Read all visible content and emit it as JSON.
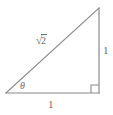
{
  "figure": {
    "type": "right-triangle-diagram",
    "stroke_color": "#8a8a8a",
    "label_color": "#6b6b6b",
    "background_color": "#ffffff",
    "width": 113,
    "height": 115,
    "vertices": {
      "left": {
        "x": 6,
        "y": 93
      },
      "bottom_right": {
        "x": 99,
        "y": 93
      },
      "top_right": {
        "x": 99,
        "y": 8
      }
    },
    "right_angle_marker": {
      "name": "right-angle-square",
      "x": 91,
      "y": 85,
      "size": 8
    },
    "labels": {
      "hypotenuse": {
        "text": "√2",
        "radical_symbol": "√",
        "radicand": "2",
        "meaning": "square root of 2"
      },
      "vertical_leg": {
        "text": "1"
      },
      "horizontal_leg": {
        "text": "1"
      },
      "angle": {
        "text": "θ",
        "meaning": "theta"
      }
    }
  }
}
